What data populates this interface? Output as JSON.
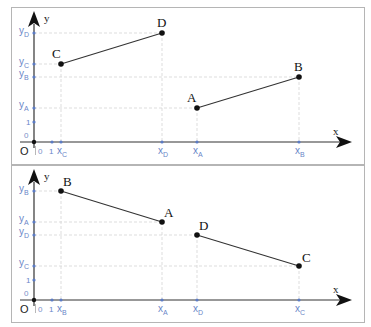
{
  "colors": {
    "axis": "#333333",
    "tick": "#5b7bc4",
    "tick_label": "#5b7bc4",
    "grid": "#cfcfcf",
    "frame": "#b5b5b5",
    "point": "#111111"
  },
  "panels": [
    {
      "axis_x_label": "x",
      "axis_y_label": "y",
      "origin_label": "O",
      "x_zero": "0",
      "y_zero": "0",
      "x_one": "1",
      "y_one": "1",
      "points": [
        {
          "name": "A",
          "x_label": "x",
          "x_sub": "A",
          "y_label": "y",
          "y_sub": "A"
        },
        {
          "name": "B",
          "x_label": "x",
          "x_sub": "B",
          "y_label": "y",
          "y_sub": "B"
        },
        {
          "name": "C",
          "x_label": "x",
          "x_sub": "C",
          "y_label": "y",
          "y_sub": "C"
        },
        {
          "name": "D",
          "x_label": "x",
          "x_sub": "D",
          "y_label": "y",
          "y_sub": "D"
        }
      ],
      "segments": [
        "CD",
        "AB"
      ]
    },
    {
      "axis_x_label": "x",
      "axis_y_label": "y",
      "origin_label": "O",
      "x_zero": "0",
      "y_zero": "0",
      "x_one": "1",
      "y_one": "1",
      "points": [
        {
          "name": "A",
          "x_label": "x",
          "x_sub": "A",
          "y_label": "y",
          "y_sub": "A"
        },
        {
          "name": "B",
          "x_label": "x",
          "x_sub": "B",
          "y_label": "y",
          "y_sub": "B"
        },
        {
          "name": "C",
          "x_label": "x",
          "x_sub": "C",
          "y_label": "y",
          "y_sub": "C"
        },
        {
          "name": "D",
          "x_label": "x",
          "x_sub": "D",
          "y_label": "y",
          "y_sub": "D"
        }
      ],
      "segments": [
        "BA",
        "DC"
      ]
    }
  ]
}
